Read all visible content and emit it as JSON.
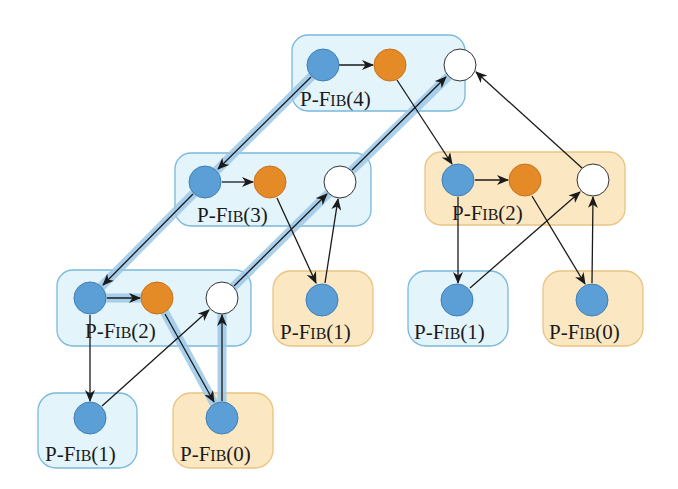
{
  "colors": {
    "blue_box_fill": "#e3f4fb",
    "blue_box_stroke": "#7ab8dc",
    "orange_box_fill": "#fbe8c3",
    "orange_box_stroke": "#e9c382",
    "strand_blue": "#5b9fd6",
    "strand_orange": "#e48a27",
    "strand_white": "#ffffff",
    "edge": "#1a1a1a",
    "critical_path_glow": "#9cc8e8"
  },
  "procedures": [
    {
      "id": "fib4",
      "label_prefix": "P-F",
      "label_sc": "IB",
      "label_arg": "(4)",
      "kind": "spawn",
      "color": "blue"
    },
    {
      "id": "fib3",
      "label_prefix": "P-F",
      "label_sc": "IB",
      "label_arg": "(3)",
      "kind": "spawn",
      "color": "blue"
    },
    {
      "id": "fib2r",
      "label_prefix": "P-F",
      "label_sc": "IB",
      "label_arg": "(2)",
      "kind": "spawn",
      "color": "orange"
    },
    {
      "id": "fib2l",
      "label_prefix": "P-F",
      "label_sc": "IB",
      "label_arg": "(2)",
      "kind": "spawn",
      "color": "blue"
    },
    {
      "id": "fib1a",
      "label_prefix": "P-F",
      "label_sc": "IB",
      "label_arg": "(1)",
      "kind": "leaf",
      "color": "orange"
    },
    {
      "id": "fib1b",
      "label_prefix": "P-F",
      "label_sc": "IB",
      "label_arg": "(1)",
      "kind": "leaf",
      "color": "blue"
    },
    {
      "id": "fib0a",
      "label_prefix": "P-F",
      "label_sc": "IB",
      "label_arg": "(0)",
      "kind": "leaf",
      "color": "orange"
    },
    {
      "id": "fib1c",
      "label_prefix": "P-F",
      "label_sc": "IB",
      "label_arg": "(1)",
      "kind": "leaf",
      "color": "blue"
    },
    {
      "id": "fib0b",
      "label_prefix": "P-F",
      "label_sc": "IB",
      "label_arg": "(0)",
      "kind": "leaf",
      "color": "orange"
    }
  ],
  "legend_strands": {
    "blue": "initial strand",
    "orange": "continuation after spawn",
    "white": "strand after sync"
  },
  "critical_path": [
    "fib4.blue",
    "fib3.blue",
    "fib2l.blue",
    "fib2l.orange",
    "fib0b.blue",
    "fib2l.white",
    "fib3.white",
    "fib4.white"
  ]
}
